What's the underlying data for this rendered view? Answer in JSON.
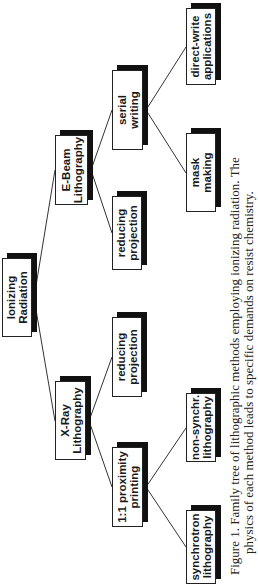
{
  "diagram": {
    "root": {
      "label": "Ionizing\nRadiation"
    },
    "level1": [
      {
        "label": "X-Ray\nLithography"
      },
      {
        "label": "E-Beam\nLithography"
      }
    ],
    "level2": [
      {
        "label": "1:1  proximity\nprinting"
      },
      {
        "label": "reducing\nprojection"
      },
      {
        "label": "reducing\nprojection"
      },
      {
        "label": "serial\nwriting"
      }
    ],
    "level3": [
      {
        "label": "synchrotron\nlithography"
      },
      {
        "label": "non-synchr.\nlithography"
      },
      {
        "label": "mask\nmaking"
      },
      {
        "label": "direct-write\napplications"
      }
    ]
  },
  "caption": {
    "line1": "Figure 1.  Family tree of lithographic methods employing ionizing radiation.  The",
    "line2": "physics of each method leads to specific demands on resist chemistry."
  },
  "colors": {
    "box_border": "#222222",
    "shadow": "#111111",
    "line": "#333333",
    "background": "#ffffff"
  }
}
